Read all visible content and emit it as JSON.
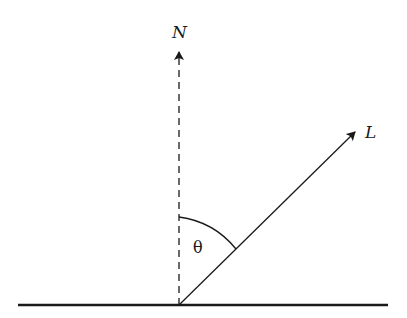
{
  "diagram": {
    "normal_label": "N",
    "light_label": "L",
    "angle_label": "θ",
    "colors": {
      "stroke": "#1a1a1a",
      "background": "#ffffff"
    }
  }
}
